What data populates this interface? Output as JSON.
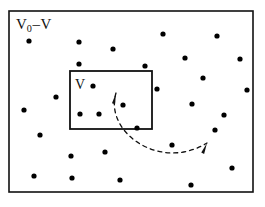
{
  "figure": {
    "type": "diagram",
    "background_color": "#ffffff",
    "stroke_color": "#111111",
    "dot_color": "#000000",
    "width": 265,
    "height": 207
  },
  "labels": {
    "outer_region": {
      "symbol": "V",
      "subscript": "0",
      "operator": "–",
      "second_symbol": "V",
      "full_text": "V0–V"
    },
    "inner_region": {
      "symbol": "V",
      "full_text": "V"
    }
  },
  "boxes": [
    {
      "name": "outer-box",
      "label": "V0-V",
      "x": 9,
      "y": 11,
      "width": 244,
      "height": 181,
      "stroke_width": 1.6
    },
    {
      "name": "inner-box",
      "label": "V",
      "x": 70,
      "y": 71,
      "width": 82,
      "height": 58,
      "stroke_width": 1.8
    }
  ],
  "arrow": {
    "name": "double-headed-dashed-arrow",
    "style": "dashed",
    "dash_pattern": "4,4",
    "stroke_width": 1.3,
    "heads": "both",
    "start": [
      116,
      93
    ],
    "control_1": [
      104,
      132
    ],
    "control_2": [
      160,
      172
    ],
    "end": [
      207,
      143
    ]
  },
  "points": {
    "count": 31,
    "radius": 2.6,
    "inside_inner_box": [
      [
        93,
        86
      ],
      [
        80,
        114
      ],
      [
        99,
        114
      ],
      [
        123,
        105
      ]
    ],
    "outside_inner_box": [
      [
        29,
        41
      ],
      [
        79,
        42
      ],
      [
        79,
        64
      ],
      [
        113,
        49
      ],
      [
        163,
        34
      ],
      [
        217,
        36
      ],
      [
        203,
        78
      ],
      [
        157,
        89
      ],
      [
        192,
        104
      ],
      [
        224,
        115
      ],
      [
        40,
        135
      ],
      [
        105,
        152
      ],
      [
        71,
        156
      ],
      [
        172,
        145
      ],
      [
        34,
        176
      ],
      [
        72,
        178
      ],
      [
        120,
        180
      ],
      [
        191,
        185
      ],
      [
        232,
        168
      ],
      [
        247,
        90
      ],
      [
        137,
        128
      ],
      [
        56,
        97
      ],
      [
        145,
        66
      ],
      [
        185,
        58
      ],
      [
        240,
        59
      ],
      [
        24,
        110
      ],
      [
        215,
        130
      ]
    ]
  }
}
